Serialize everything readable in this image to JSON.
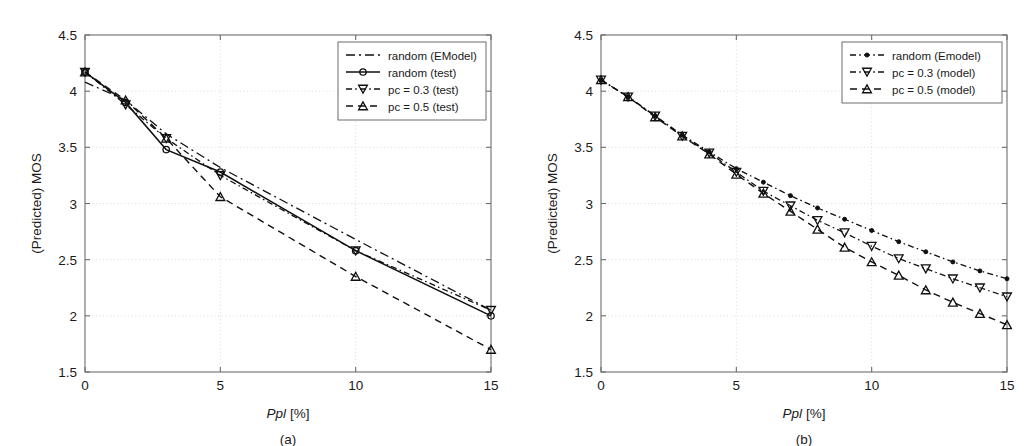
{
  "figure": {
    "panels": [
      {
        "id": "a",
        "caption": "(a)",
        "xlabel_italic": "Ppl",
        "xlabel_rest": " [%]",
        "ylabel": "(Predicted) MOS",
        "legend": [
          {
            "label": "random (EModel)",
            "style": "dashdot",
            "marker": "none"
          },
          {
            "label": "random (test)",
            "style": "solid",
            "marker": "circle"
          },
          {
            "label": "pc = 0.3 (test)",
            "style": "dotdash",
            "marker": "triangle-down"
          },
          {
            "label": "pc = 0.5 (test)",
            "style": "dashed",
            "marker": "triangle-up"
          }
        ]
      },
      {
        "id": "b",
        "caption": "(b)",
        "xlabel_italic": "Ppl",
        "xlabel_rest": " [%]",
        "ylabel": "(Predicted) MOS",
        "legend": [
          {
            "label": "random (Emodel)",
            "style": "dotdash",
            "marker": "dot"
          },
          {
            "label": "pc = 0.3 (model)",
            "style": "dotdash",
            "marker": "triangle-down"
          },
          {
            "label": "pc = 0.5 (model)",
            "style": "dashed",
            "marker": "triangle-up"
          }
        ]
      }
    ]
  },
  "chart_data": [
    {
      "type": "line",
      "panel": "a",
      "title": "",
      "xlabel": "Ppl [%]",
      "ylabel": "(Predicted) MOS",
      "xlim": [
        0,
        15
      ],
      "ylim": [
        1.5,
        4.5
      ],
      "xticks": [
        0,
        5,
        10,
        15
      ],
      "yticks": [
        1.5,
        2,
        2.5,
        3,
        3.5,
        4,
        4.5
      ],
      "grid": true,
      "legend_position": "top-right",
      "series": [
        {
          "name": "random (EModel)",
          "style": "dashdot",
          "marker": "none",
          "x": [
            0,
            1.5,
            3,
            5,
            10,
            15
          ],
          "y": [
            4.08,
            3.92,
            3.62,
            3.32,
            2.68,
            2.05
          ]
        },
        {
          "name": "random (test)",
          "style": "solid",
          "marker": "circle",
          "x": [
            0,
            1.5,
            3,
            5,
            10,
            15
          ],
          "y": [
            4.17,
            3.9,
            3.48,
            3.28,
            2.58,
            2.0
          ]
        },
        {
          "name": "pc = 0.3 (test)",
          "style": "dotdash",
          "marker": "triangle-down",
          "x": [
            0,
            1.5,
            3,
            5,
            10,
            15
          ],
          "y": [
            4.17,
            3.88,
            3.58,
            3.25,
            2.58,
            2.05
          ]
        },
        {
          "name": "pc = 0.5 (test)",
          "style": "dashed",
          "marker": "triangle-up",
          "x": [
            0,
            1.5,
            3,
            5,
            10,
            15
          ],
          "y": [
            4.17,
            3.92,
            3.58,
            3.06,
            2.35,
            1.7
          ]
        }
      ]
    },
    {
      "type": "line",
      "panel": "b",
      "title": "",
      "xlabel": "Ppl [%]",
      "ylabel": "(Predicted) MOS",
      "xlim": [
        0,
        15
      ],
      "ylim": [
        1.5,
        4.5
      ],
      "xticks": [
        0,
        5,
        10,
        15
      ],
      "yticks": [
        1.5,
        2,
        2.5,
        3,
        3.5,
        4,
        4.5
      ],
      "grid": true,
      "legend_position": "top-right",
      "series": [
        {
          "name": "random (Emodel)",
          "style": "dotdash",
          "marker": "dot",
          "x": [
            0,
            1,
            2,
            3,
            4,
            5,
            6,
            7,
            8,
            9,
            10,
            11,
            12,
            13,
            14,
            15
          ],
          "y": [
            4.1,
            3.95,
            3.78,
            3.61,
            3.46,
            3.31,
            3.19,
            3.07,
            2.96,
            2.86,
            2.76,
            2.66,
            2.57,
            2.48,
            2.4,
            2.33
          ]
        },
        {
          "name": "pc = 0.3 (model)",
          "style": "dotdash",
          "marker": "triangle-down",
          "x": [
            0,
            1,
            2,
            3,
            4,
            5,
            6,
            7,
            8,
            9,
            10,
            11,
            12,
            13,
            14,
            15
          ],
          "y": [
            4.1,
            3.95,
            3.78,
            3.6,
            3.45,
            3.28,
            3.11,
            2.98,
            2.85,
            2.74,
            2.62,
            2.51,
            2.42,
            2.33,
            2.25,
            2.17
          ]
        },
        {
          "name": "pc = 0.5 (model)",
          "style": "dashed",
          "marker": "triangle-up",
          "x": [
            0,
            1,
            2,
            3,
            4,
            5,
            6,
            7,
            8,
            9,
            10,
            11,
            12,
            13,
            14,
            15
          ],
          "y": [
            4.1,
            3.95,
            3.77,
            3.6,
            3.44,
            3.26,
            3.09,
            2.93,
            2.77,
            2.61,
            2.48,
            2.36,
            2.23,
            2.12,
            2.02,
            1.92
          ]
        }
      ]
    }
  ]
}
